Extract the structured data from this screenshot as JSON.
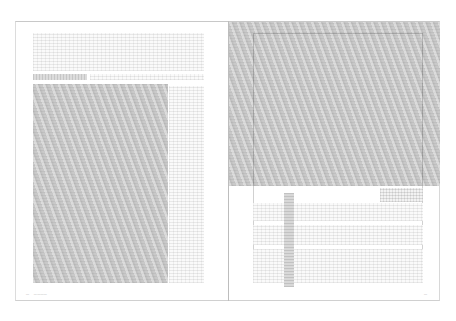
{
  "document": {
    "type": "two-page spread",
    "content_state": "greeked placeholder layout"
  },
  "left_page": {
    "top_text_block": {
      "text": ""
    },
    "caption": {
      "text": ""
    },
    "image": {
      "description": "grey placeholder image"
    },
    "side_text_column": {
      "text": ""
    },
    "footer": {
      "page_number": "—",
      "running_head": "————"
    }
  },
  "right_page": {
    "image": {
      "description": "grey placeholder image, full-bleed top"
    },
    "callout_block": {
      "text": ""
    },
    "text_columns": {
      "text": ""
    },
    "footer": {
      "page_number": "—"
    }
  },
  "colors": {
    "image_grey": "#c9c9c9",
    "border": "#c8c8c8",
    "background": "#ffffff"
  }
}
